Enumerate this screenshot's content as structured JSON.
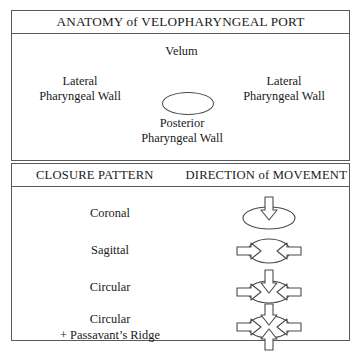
{
  "figure": {
    "anatomy": {
      "title": "ANATOMY of VELOPHARYNGEAL PORT",
      "velum_label": "Velum",
      "lateral_left_line1": "Lateral",
      "lateral_left_line2": "Pharyngeal Wall",
      "lateral_right_line1": "Lateral",
      "lateral_right_line2": "Pharyngeal Wall",
      "posterior_line1": "Posterior",
      "posterior_line2": "Pharyngeal Wall",
      "port_shape": "ellipse-icon"
    },
    "closure": {
      "header_left": "CLOSURE PATTERN",
      "header_right": "DIRECTION of MOVEMENT",
      "rows": [
        {
          "label": "Coronal",
          "label_line2": "",
          "arrows": [
            "down"
          ],
          "glyph": "ellipse-wide-with-down-arrow-icon"
        },
        {
          "label": "Sagittal",
          "label_line2": "",
          "arrows": [
            "left",
            "right"
          ],
          "glyph": "ellipse-with-horizontal-arrows-icon"
        },
        {
          "label": "Circular",
          "label_line2": "",
          "arrows": [
            "down",
            "left",
            "right"
          ],
          "glyph": "ellipse-with-three-arrows-icon"
        },
        {
          "label": "Circular",
          "label_line2": "+ Passavant’s Ridge",
          "arrows": [
            "down",
            "left",
            "right",
            "up"
          ],
          "glyph": "ellipse-with-four-arrows-icon"
        }
      ]
    },
    "colors": {
      "border": "#5a5a5a",
      "ink": "#1a1a1a",
      "stroke": "#4a4a4a",
      "background": "#ffffff"
    }
  }
}
